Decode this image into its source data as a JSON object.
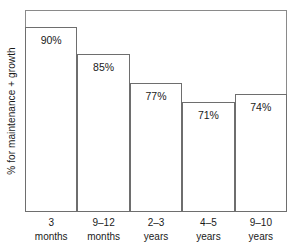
{
  "chart_data": {
    "type": "bar",
    "title": "",
    "subtitle": "",
    "xlabel": "",
    "ylabel": "% for maintenance + growth",
    "categories": [
      "3 months",
      "9–12 months",
      "2–3 years",
      "4–5 years",
      "9–10 years"
    ],
    "category_lines": [
      {
        "line1": "3",
        "line2": "months"
      },
      {
        "line1": "9–12",
        "line2": "months"
      },
      {
        "line1": "2–3",
        "line2": "years"
      },
      {
        "line1": "4–5",
        "line2": "years"
      },
      {
        "line1": "9–10",
        "line2": "years"
      }
    ],
    "values": [
      90,
      85,
      77,
      71,
      74
    ],
    "value_labels": [
      "90%",
      "85%",
      "77%",
      "71%",
      "74%"
    ],
    "ylim": [
      0,
      98
    ],
    "grid": false,
    "legend": null,
    "annotations": [],
    "bar_style": {
      "fill": "none",
      "outline_color": "#6e6e6e",
      "gap": 0
    },
    "frame": {
      "border_color": "#8a8a8a",
      "background": "#ffffff"
    }
  },
  "bars": [
    {
      "value_label": "90%",
      "left_pct": 0.0,
      "width_pct": 20.0,
      "height_pct": 91.8
    },
    {
      "value_label": "85%",
      "left_pct": 20.0,
      "width_pct": 20.0,
      "height_pct": 78.2
    },
    {
      "value_label": "77%",
      "left_pct": 40.0,
      "width_pct": 20.0,
      "height_pct": 63.9
    },
    {
      "value_label": "71%",
      "left_pct": 60.0,
      "width_pct": 20.0,
      "height_pct": 54.4
    },
    {
      "value_label": "74%",
      "left_pct": 80.0,
      "width_pct": 20.0,
      "height_pct": 58.4
    }
  ]
}
